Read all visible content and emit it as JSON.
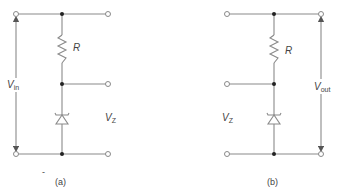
{
  "figure": {
    "panels": [
      {
        "id": "a",
        "caption": "(a)",
        "resistor_label": "R",
        "zener_label_main": "V",
        "zener_label_sub": "Z",
        "voltage_label_main": "V",
        "voltage_label_sub": "in",
        "voltage_side": "left",
        "stray_mark": "-"
      },
      {
        "id": "b",
        "caption": "(b)",
        "resistor_label": "R",
        "zener_label_main": "V",
        "zener_label_sub": "Z",
        "voltage_label_main": "V",
        "voltage_label_sub": "out",
        "voltage_side": "right"
      }
    ],
    "colors": {
      "wire": "#8a8a8a",
      "node": "#222222",
      "text": "#444444"
    }
  }
}
